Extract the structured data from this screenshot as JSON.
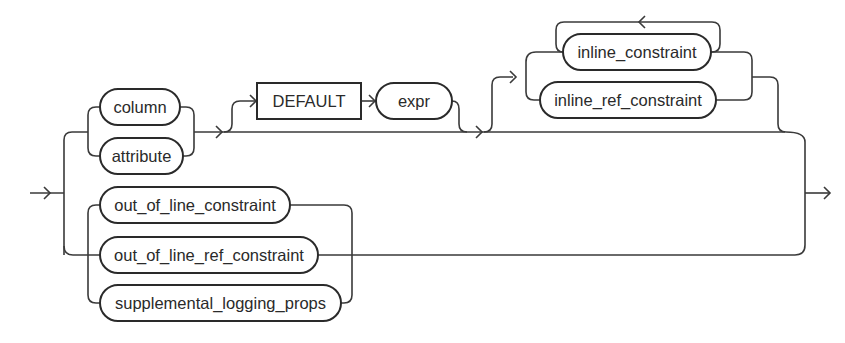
{
  "diagram": {
    "type": "railroad-syntax-diagram",
    "entry_arrow": "→",
    "exit_arrow": "→",
    "branches": [
      {
        "name": "column-definition-branch",
        "choice_1": [
          "column",
          "attribute"
        ],
        "optional_default": {
          "keyword": "DEFAULT",
          "expression": "expr"
        },
        "optional_repeating_constraints": [
          "inline_constraint",
          "inline_ref_constraint"
        ]
      },
      {
        "name": "out-of-line-branch",
        "choices": [
          "out_of_line_constraint",
          "out_of_line_ref_constraint",
          "supplemental_logging_props"
        ]
      }
    ],
    "nodes": {
      "column": "column",
      "attribute": "attribute",
      "default_keyword": "DEFAULT",
      "expr": "expr",
      "inline_constraint": "inline_constraint",
      "inline_ref_constraint": "inline_ref_constraint",
      "out_of_line_constraint": "out_of_line_constraint",
      "out_of_line_ref_constraint": "out_of_line_ref_constraint",
      "supplemental_logging_props": "supplemental_logging_props"
    }
  }
}
